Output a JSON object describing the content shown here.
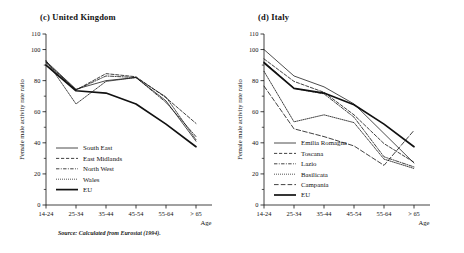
{
  "figure": {
    "source_note": "Source: Calculated from Eurostat (1994)."
  },
  "panels": [
    {
      "id": "united-kingdom",
      "title": "(c) United Kingdom",
      "chart_data": {
        "type": "line",
        "title": "(c) United Kingdom",
        "xlabel": "Age",
        "ylabel": "Female male activity rate ratio",
        "categories": [
          "14-24",
          "25-34",
          "35-44",
          "45-54",
          "55-64",
          "> 65"
        ],
        "ylim": [
          0,
          110
        ],
        "yticks": [
          0,
          20,
          40,
          60,
          80,
          100,
          110
        ],
        "yminor": [
          10,
          30,
          50,
          70,
          90
        ],
        "grid": false,
        "legend_position": "lower-left",
        "series": [
          {
            "name": "South East",
            "style": "solid-thin",
            "values": [
              92.5,
              74.5,
              80.0,
              82.0,
              67.0,
              41.0
            ]
          },
          {
            "name": "East Midlands",
            "style": "dashed",
            "values": [
              92.0,
              74.0,
              84.5,
              82.5,
              69.0,
              52.5
            ]
          },
          {
            "name": "North West",
            "style": "dash-dot",
            "values": [
              91.5,
              74.0,
              83.0,
              82.0,
              66.0,
              44.0
            ]
          },
          {
            "name": "Wales",
            "style": "dotted",
            "values": [
              93.0,
              65.0,
              79.5,
              82.0,
              69.5,
              42.0
            ]
          },
          {
            "name": "EU",
            "style": "solid-thick",
            "values": [
              90.0,
              73.5,
              72.0,
              65.0,
              52.0,
              37.5
            ]
          }
        ]
      }
    },
    {
      "id": "italy",
      "title": "(d) Italy",
      "chart_data": {
        "type": "line",
        "title": "(d) Italy",
        "xlabel": "Age",
        "ylabel": "Female male activity rate ratio",
        "categories": [
          "14-24",
          "25-34",
          "35-44",
          "45-54",
          "55-64",
          "> 65"
        ],
        "ylim": [
          0,
          110
        ],
        "yticks": [
          0,
          20,
          40,
          60,
          80,
          100,
          110
        ],
        "yminor": [
          10,
          30,
          50,
          70,
          90
        ],
        "grid": false,
        "legend_position": "lower-left",
        "series": [
          {
            "name": "Emilia Romagna",
            "style": "solid-thin",
            "values": [
              100.0,
              83.0,
              76.0,
              65.0,
              46.0,
              27.0
            ]
          },
          {
            "name": "Toscana",
            "style": "dashed",
            "values": [
              94.0,
              79.5,
              72.5,
              58.0,
              39.5,
              27.5
            ]
          },
          {
            "name": "Lazio",
            "style": "dash-dot",
            "values": [
              92.0,
              75.0,
              71.5,
              56.5,
              31.0,
              24.5
            ]
          },
          {
            "name": "Basilicata",
            "style": "dotted",
            "values": [
              86.0,
              53.5,
              58.0,
              53.0,
              29.5,
              23.5
            ]
          },
          {
            "name": "Campania",
            "style": "long-dash",
            "values": [
              76.5,
              49.0,
              44.0,
              38.0,
              25.5,
              48.0
            ]
          },
          {
            "name": "EU",
            "style": "solid-thick",
            "values": [
              91.5,
              75.0,
              72.0,
              64.5,
              52.0,
              37.5
            ]
          }
        ]
      }
    }
  ]
}
